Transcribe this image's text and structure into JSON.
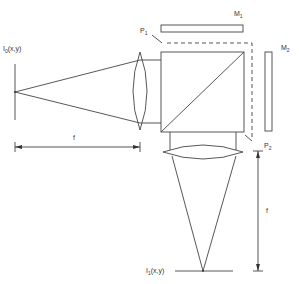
{
  "diagram": {
    "type": "optical-setup",
    "labels": {
      "input_plane": {
        "base": "I",
        "sub": "0",
        "rest": "(x,y)"
      },
      "output_plane": {
        "base": "I",
        "sub": "1",
        "rest": "(x,y)"
      },
      "focal_horizontal": "f",
      "focal_vertical": "f",
      "p1": {
        "base": "P",
        "sub": "1"
      },
      "p2": {
        "base": "P",
        "sub": "2"
      },
      "m1": {
        "base": "M",
        "sub": "1"
      },
      "m2": {
        "base": "M",
        "sub": "2"
      }
    },
    "components": [
      "input-plane",
      "lens-1",
      "beam-splitter-cube",
      "mirror-m1",
      "mirror-m2",
      "lens-2",
      "output-plane"
    ],
    "colors": {
      "line": "#444444",
      "background": "#ffffff"
    }
  }
}
